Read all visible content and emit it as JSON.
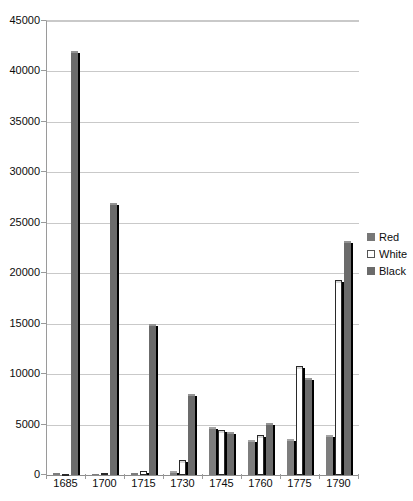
{
  "chart_data": {
    "type": "bar",
    "title": "",
    "subtitle": "",
    "xlabel": "",
    "ylabel": "",
    "ylim": [
      0,
      45000
    ],
    "ytick_step": 5000,
    "grid": true,
    "legend_position": "right",
    "categories": [
      "1685",
      "1700",
      "1715",
      "1730",
      "1745",
      "1760",
      "1775",
      "1790"
    ],
    "yticks": [
      "0",
      "5000",
      "10000",
      "15000",
      "20000",
      "25000",
      "30000",
      "35000",
      "40000",
      "45000"
    ],
    "series": [
      {
        "name": "Red",
        "color": "#7d7d7d",
        "values": [
          200,
          150,
          200,
          400,
          4800,
          3500,
          3600,
          4000
        ]
      },
      {
        "name": "White",
        "color": "#ffffff",
        "values": [
          150,
          200,
          350,
          1500,
          4500,
          4000,
          10800,
          19300
        ]
      },
      {
        "name": "Black",
        "color": "#6b6b6b",
        "values": [
          42000,
          27000,
          15000,
          8000,
          4300,
          5200,
          9600,
          23200
        ]
      }
    ]
  },
  "legend": {
    "items": [
      {
        "label": "Red",
        "swatch": "swatch-red"
      },
      {
        "label": "White",
        "swatch": "swatch-white"
      },
      {
        "label": "Black",
        "swatch": "swatch-black"
      }
    ]
  }
}
